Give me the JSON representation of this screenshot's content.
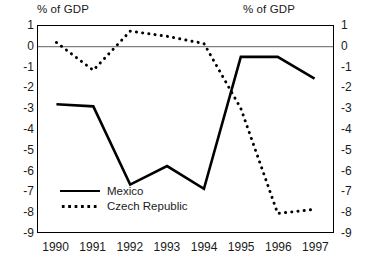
{
  "chart_data": {
    "type": "line",
    "title": "",
    "xlabel": "",
    "ylabel": "% of GDP",
    "ylabel_right": "% of GDP",
    "categories": [
      "1990",
      "1991",
      "1992",
      "1993",
      "1994",
      "1995",
      "1996",
      "1997"
    ],
    "ylim": [
      -9,
      1
    ],
    "yticks": [
      1,
      0,
      -1,
      -2,
      -3,
      -4,
      -5,
      -6,
      -7,
      -8,
      -9
    ],
    "ytick_labels": [
      "1",
      "0",
      "-1",
      "-2",
      "-3",
      "-4",
      "-5",
      "-6",
      "-7",
      "-8",
      "-9"
    ],
    "grid": false,
    "zero_line": true,
    "legend_position": "lower-left-inside",
    "series": [
      {
        "name": "Mexico",
        "style": "solid",
        "color": "#000000",
        "values": [
          -2.8,
          -2.9,
          -6.7,
          -5.8,
          -6.9,
          -0.5,
          -0.5,
          -1.55
        ]
      },
      {
        "name": "Czech Republic",
        "style": "dotted",
        "color": "#000000",
        "values": [
          0.2,
          -1.15,
          0.75,
          0.5,
          0.15,
          -3.0,
          -8.1,
          -7.9
        ]
      }
    ]
  },
  "labels": {
    "axis_title_left": "% of GDP",
    "axis_title_right": "% of GDP"
  }
}
